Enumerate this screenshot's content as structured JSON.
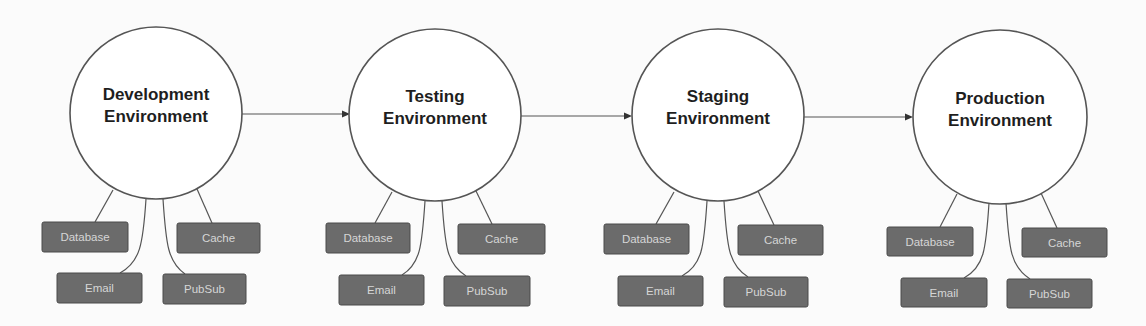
{
  "diagram": {
    "title": "",
    "colors": {
      "background": "#fbfbfb",
      "circle_fill": "#ffffff",
      "circle_stroke": "#555555",
      "box_fill": "#6b6b6b",
      "box_text": "#d6d6d6",
      "label_text": "#1e1e1e"
    },
    "environments": [
      {
        "name": "Development Environment",
        "label_lines": [
          "Development",
          "Environment"
        ],
        "circle": {
          "cx": 156,
          "cy": 113,
          "r": 86
        },
        "services": [
          {
            "label": "Database",
            "x": 42,
            "y": 222,
            "w": 86,
            "h": 30
          },
          {
            "label": "Cache",
            "x": 177,
            "y": 223,
            "w": 83,
            "h": 30
          },
          {
            "label": "Email",
            "x": 57,
            "y": 273,
            "w": 85,
            "h": 30
          },
          {
            "label": "PubSub",
            "x": 163,
            "y": 274,
            "w": 83,
            "h": 30
          }
        ],
        "connectors": [
          "M113,190 L95,222",
          "M197,189 L212,223",
          "M146,199 C143,245 140,262 120,273",
          "M163,199 C166,245 168,262 185,274"
        ]
      },
      {
        "name": "Testing Environment",
        "label_lines": [
          "Testing",
          "Environment"
        ],
        "circle": {
          "cx": 435,
          "cy": 115,
          "r": 86
        },
        "services": [
          {
            "label": "Database",
            "x": 326,
            "y": 223,
            "w": 84,
            "h": 30
          },
          {
            "label": "Cache",
            "x": 458,
            "y": 224,
            "w": 87,
            "h": 30
          },
          {
            "label": "Email",
            "x": 339,
            "y": 275,
            "w": 85,
            "h": 30
          },
          {
            "label": "PubSub",
            "x": 444,
            "y": 276,
            "w": 86,
            "h": 30
          }
        ],
        "connectors": [
          "M392,192 L375,223",
          "M476,191 L492,224",
          "M425,201 C422,247 420,264 402,275",
          "M442,201 C445,247 447,264 466,276"
        ]
      },
      {
        "name": "Staging Environment",
        "label_lines": [
          "Staging",
          "Environment"
        ],
        "circle": {
          "cx": 718,
          "cy": 115,
          "r": 86
        },
        "services": [
          {
            "label": "Database",
            "x": 604,
            "y": 224,
            "w": 85,
            "h": 30
          },
          {
            "label": "Cache",
            "x": 738,
            "y": 225,
            "w": 85,
            "h": 30
          },
          {
            "label": "Email",
            "x": 618,
            "y": 276,
            "w": 85,
            "h": 30
          },
          {
            "label": "PubSub",
            "x": 724,
            "y": 277,
            "w": 84,
            "h": 30
          }
        ],
        "connectors": [
          "M674,192 L656,224",
          "M758,191 L774,225",
          "M707,201 C704,248 702,265 682,276",
          "M724,201 C727,248 729,265 748,277"
        ]
      },
      {
        "name": "Production Environment",
        "label_lines": [
          "Production",
          "Environment"
        ],
        "circle": {
          "cx": 1000,
          "cy": 117,
          "r": 87
        },
        "services": [
          {
            "label": "Database",
            "x": 887,
            "y": 227,
            "w": 86,
            "h": 29
          },
          {
            "label": "Cache",
            "x": 1022,
            "y": 228,
            "w": 85,
            "h": 29
          },
          {
            "label": "Email",
            "x": 901,
            "y": 278,
            "w": 86,
            "h": 29
          },
          {
            "label": "PubSub",
            "x": 1007,
            "y": 279,
            "w": 85,
            "h": 29
          }
        ],
        "connectors": [
          "M957,194 L940,227",
          "M1041,193 L1057,228",
          "M989,203 C986,250 984,267 964,278",
          "M1006,203 C1009,250 1011,267 1030,279"
        ]
      }
    ],
    "flow_arrows": [
      {
        "from": "Development Environment",
        "to": "Testing Environment",
        "x1": 242,
        "y1": 114,
        "x2": 350,
        "y2": 114
      },
      {
        "from": "Testing Environment",
        "to": "Staging Environment",
        "x1": 521,
        "y1": 116,
        "x2": 632,
        "y2": 116
      },
      {
        "from": "Staging Environment",
        "to": "Production Environment",
        "x1": 804,
        "y1": 117,
        "x2": 913,
        "y2": 117
      }
    ]
  }
}
